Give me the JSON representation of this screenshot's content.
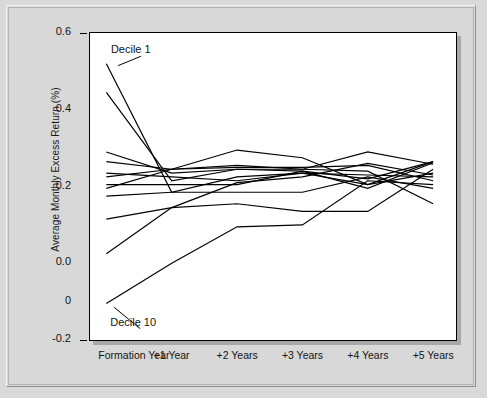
{
  "chart_data": {
    "type": "line",
    "title": "",
    "xlabel": "",
    "ylabel": "Average Monthly Excess Return (%)",
    "categories": [
      "Formation Year",
      "+1 Year",
      "+2 Years",
      "+3 Years",
      "+4 Years",
      "+5 Years"
    ],
    "x": [
      0,
      1,
      2,
      3,
      4,
      5
    ],
    "ylim": [
      -0.2,
      0.6
    ],
    "xlim": [
      -0.25,
      5.35
    ],
    "ytick_values": [
      0.6,
      0.4,
      0.2,
      0.0,
      -0.1,
      -0.2
    ],
    "ytick_labels": [
      "0.6",
      "0.4",
      "0.2",
      "0.0",
      "0",
      "-0.2"
    ],
    "grid": false,
    "legend": "none",
    "annotations": [
      {
        "text": "Decile 1",
        "x": 0.07,
        "y": 0.555,
        "leader_to_x": 0.18,
        "leader_to_y": 0.515
      },
      {
        "text": "Decile 10",
        "x": 0.06,
        "y": -0.155,
        "leader_to_x": 0.12,
        "leader_to_y": -0.115
      }
    ],
    "series": [
      {
        "name": "Decile 1",
        "values": [
          0.52,
          0.185,
          0.225,
          0.235,
          0.205,
          0.265
        ]
      },
      {
        "name": "Decile 2",
        "values": [
          0.445,
          0.215,
          0.245,
          0.24,
          0.195,
          0.262
        ]
      },
      {
        "name": "Decile 3",
        "values": [
          0.29,
          0.235,
          0.245,
          0.245,
          0.29,
          0.258
        ]
      },
      {
        "name": "Decile 4",
        "values": [
          0.265,
          0.245,
          0.25,
          0.25,
          0.255,
          0.215
        ]
      },
      {
        "name": "Decile 5",
        "values": [
          0.235,
          0.225,
          0.215,
          0.235,
          0.23,
          0.225
        ]
      },
      {
        "name": "Decile 6",
        "values": [
          0.225,
          0.245,
          0.255,
          0.245,
          0.24,
          0.155
        ]
      },
      {
        "name": "Decile 7",
        "values": [
          0.205,
          0.205,
          0.205,
          0.24,
          0.22,
          0.265
        ]
      },
      {
        "name": "Decile 8",
        "values": [
          0.195,
          0.245,
          0.295,
          0.275,
          0.205,
          0.235
        ]
      },
      {
        "name": "Decile 9",
        "values": [
          0.175,
          0.185,
          0.185,
          0.185,
          0.225,
          0.195
        ]
      },
      {
        "name": "Decile 10-upper",
        "values": [
          0.115,
          0.145,
          0.155,
          0.135,
          0.135,
          0.245
        ]
      },
      {
        "name": "Decile 10-mid",
        "values": [
          0.025,
          0.145,
          0.21,
          0.225,
          0.26,
          0.23
        ]
      },
      {
        "name": "Decile 10",
        "values": [
          -0.105,
          0.0,
          0.095,
          0.1,
          0.215,
          0.205
        ]
      }
    ]
  },
  "axes": {
    "ylabel_text": "Average Monthly Excess Return (%)"
  }
}
